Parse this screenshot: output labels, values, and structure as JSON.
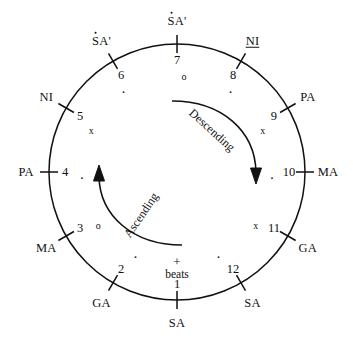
{
  "diagram": {
    "center": {
      "x": 177,
      "y": 172
    },
    "radius": 128,
    "stroke_color": "#111111",
    "background": "#ffffff",
    "beats_caption": {
      "plus": "+",
      "word": "beats"
    },
    "arrows": [
      {
        "name": "descending",
        "label": "Descending",
        "direction": "clockwise"
      },
      {
        "name": "ascending",
        "label": "Ascending",
        "direction": "counterclockwise"
      }
    ],
    "positions": [
      {
        "beat": "1",
        "swara": "SA",
        "komal": false,
        "octave_dot": false,
        "marker": "+",
        "marker_name": "plus",
        "angle": 90
      },
      {
        "beat": "2",
        "swara": "GA",
        "komal": false,
        "octave_dot": false,
        "marker": "·",
        "marker_name": "dot",
        "angle": 120
      },
      {
        "beat": "3",
        "swara": "MA",
        "komal": false,
        "octave_dot": false,
        "marker": "o",
        "marker_name": "circle",
        "angle": 150
      },
      {
        "beat": "4",
        "swara": "PA",
        "komal": false,
        "octave_dot": false,
        "marker": "·",
        "marker_name": "dot",
        "angle": 180
      },
      {
        "beat": "5",
        "swara": "NI",
        "komal": false,
        "octave_dot": false,
        "marker": "x",
        "marker_name": "cross",
        "angle": 210
      },
      {
        "beat": "6",
        "swara": "SA'",
        "komal": false,
        "octave_dot": true,
        "marker": "·",
        "marker_name": "dot",
        "angle": 240
      },
      {
        "beat": "7",
        "swara": "SA'",
        "komal": false,
        "octave_dot": true,
        "marker": "o",
        "marker_name": "circle",
        "angle": 270
      },
      {
        "beat": "8",
        "swara": "NI",
        "komal": true,
        "octave_dot": false,
        "marker": "·",
        "marker_name": "dot",
        "angle": 300
      },
      {
        "beat": "9",
        "swara": "PA",
        "komal": false,
        "octave_dot": false,
        "marker": "x",
        "marker_name": "cross",
        "angle": 330
      },
      {
        "beat": "10",
        "swara": "MA",
        "komal": false,
        "octave_dot": false,
        "marker": "·",
        "marker_name": "dot",
        "angle": 0
      },
      {
        "beat": "11",
        "swara": "GA",
        "komal": false,
        "octave_dot": false,
        "marker": "x",
        "marker_name": "cross",
        "angle": 30
      },
      {
        "beat": "12",
        "swara": "SA",
        "komal": false,
        "octave_dot": false,
        "marker": "·",
        "marker_name": "dot",
        "angle": 60
      }
    ]
  }
}
